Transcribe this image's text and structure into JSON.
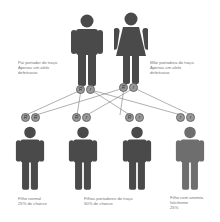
{
  "colors": {
    "figure_dark": "#4a4a4a",
    "figure_affected": "#6e6e6e",
    "allele_fill": "#9a9a9a",
    "line": "#7a7a7a"
  },
  "parents": {
    "father": {
      "caption_line1": "Pai portador do traço.",
      "caption_line2": "Apenas um alelo",
      "caption_line3": "defeituoso",
      "alleles": [
        "R",
        "r"
      ]
    },
    "mother": {
      "caption_line1": "Mãe portadora do traço.",
      "caption_line2": "Apenas um alelo",
      "caption_line3": "defeituoso",
      "alleles": [
        "R",
        "r"
      ]
    }
  },
  "children": [
    {
      "alleles": [
        "R",
        "R"
      ],
      "caption_line1": "Filho normal",
      "caption_line2": "25% de chance",
      "caption_line3": ""
    },
    {
      "alleles": [
        "R",
        "r"
      ],
      "caption_line1": "Filhos portadores do traço",
      "caption_line2": "50% de chance",
      "caption_line3": ""
    },
    {
      "alleles": [
        "R",
        "r"
      ],
      "caption_line1": "",
      "caption_line2": "",
      "caption_line3": ""
    },
    {
      "alleles": [
        "r",
        "r"
      ],
      "caption_line1": "Filho com anemia",
      "caption_line2": "falciforme",
      "caption_line3": "25%"
    }
  ]
}
